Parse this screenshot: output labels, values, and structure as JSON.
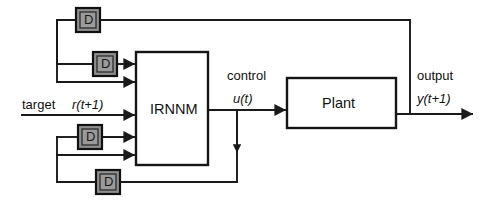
{
  "diagram": {
    "blocks": [
      {
        "id": "irnnm",
        "label": "IRNNM",
        "x": 136,
        "y": 52,
        "w": 72,
        "h": 113
      },
      {
        "id": "plant",
        "label": "Plant",
        "x": 287,
        "y": 78,
        "w": 109,
        "h": 50
      }
    ],
    "delays": [
      {
        "id": "delay-top",
        "label": "D",
        "x": 76,
        "y": 8
      },
      {
        "id": "delay-upper-input",
        "label": "D",
        "x": 93,
        "y": 52
      },
      {
        "id": "delay-lower-input",
        "label": "D",
        "x": 78,
        "y": 125
      },
      {
        "id": "delay-bottom",
        "label": "D",
        "x": 96,
        "y": 170
      }
    ],
    "signals": {
      "target_label": "target",
      "target_expr": "r(t+1)",
      "control_label": "control",
      "control_expr": "u(t)",
      "output_label": "output",
      "output_expr": "y(t+1)"
    },
    "colors": {
      "line": "#1a1a1a",
      "delay_fill": "#9a9a9a",
      "box_fill": "#ffffff",
      "background": "#ffffff"
    }
  }
}
